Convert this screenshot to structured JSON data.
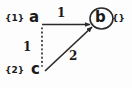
{
  "diagram": {
    "background_color": "#fdfdfd",
    "stroke_color": "#2b2b2b",
    "text_color": "#1a1a1a",
    "nodes": [
      {
        "id": "a",
        "glyph": "a",
        "set_label": "{1}",
        "circled": false,
        "x": 36,
        "y": 19
      },
      {
        "id": "b",
        "glyph": "b",
        "set_label": "{}",
        "circled": true,
        "x": 101,
        "y": 19
      },
      {
        "id": "c",
        "glyph": "c",
        "set_label": "{2}",
        "circled": false,
        "x": 38,
        "y": 70
      }
    ],
    "edges": [
      {
        "id": "a-to-b",
        "from": "a",
        "to": "b",
        "weight": "1",
        "style": "solid",
        "arrow": true
      },
      {
        "id": "a-to-c",
        "from": "a",
        "to": "c",
        "weight": "1",
        "style": "dotted",
        "arrow": false
      },
      {
        "id": "c-to-b",
        "from": "c",
        "to": "b",
        "weight": "2",
        "style": "solid",
        "arrow": true
      }
    ]
  }
}
